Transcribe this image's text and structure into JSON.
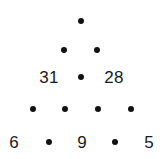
{
  "figure": {
    "type": "number-pyramid",
    "background_color": "#ffffff",
    "text_color": "#1a1a1a",
    "dot_color": "#111111",
    "dot_symbol": "•",
    "rows": [
      {
        "index": 0,
        "y": 21,
        "cells": [
          {
            "kind": "dot",
            "label": "•",
            "x": 81
          }
        ]
      },
      {
        "index": 1,
        "y": 50,
        "cells": [
          {
            "kind": "dot",
            "label": "•",
            "x": 64
          },
          {
            "kind": "dot",
            "label": "•",
            "x": 97
          }
        ]
      },
      {
        "index": 2,
        "y": 77,
        "cells": [
          {
            "kind": "value",
            "label": "31",
            "x": 49
          },
          {
            "kind": "dot",
            "label": "•",
            "x": 81
          },
          {
            "kind": "value",
            "label": "28",
            "x": 114
          }
        ]
      },
      {
        "index": 3,
        "y": 109,
        "cells": [
          {
            "kind": "dot",
            "label": "•",
            "x": 33
          },
          {
            "kind": "dot",
            "label": "•",
            "x": 65
          },
          {
            "kind": "dot",
            "label": "•",
            "x": 98
          },
          {
            "kind": "dot",
            "label": "•",
            "x": 131
          }
        ]
      },
      {
        "index": 4,
        "y": 142,
        "cells": [
          {
            "kind": "value",
            "label": "6",
            "x": 14
          },
          {
            "kind": "dot",
            "label": "•",
            "x": 49
          },
          {
            "kind": "value",
            "label": "9",
            "x": 82
          },
          {
            "kind": "dot",
            "label": "•",
            "x": 115
          },
          {
            "kind": "value",
            "label": "5",
            "x": 149
          }
        ]
      }
    ]
  }
}
